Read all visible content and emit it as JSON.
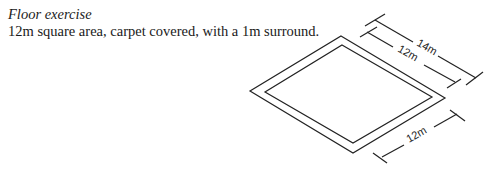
{
  "caption": {
    "title": "Floor exercise",
    "description": "12m square area, carpet covered, with a 1m surround."
  },
  "diagram": {
    "dimensions": {
      "outer_length": "14m",
      "inner_length": "12m",
      "inner_width": "12m"
    }
  }
}
